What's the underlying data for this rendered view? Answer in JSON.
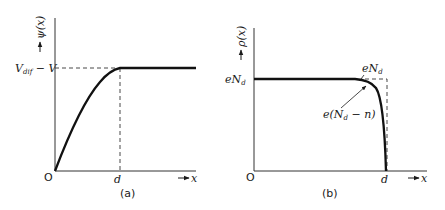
{
  "panels": [
    {
      "id": "a",
      "caption": "(a)",
      "y_axis_label": "ψ(x)",
      "x_axis_label": "x",
      "origin_label": "O",
      "x_tick_label": "d",
      "level_label": "V",
      "level_label_sub": "dif",
      "level_label_suffix": " − V",
      "curve_description": "Potential rises parabolically from 0 at x=0 to V_dif − V at x=d, constant thereafter"
    },
    {
      "id": "b",
      "caption": "(b)",
      "y_axis_label": "ρ(x)",
      "x_axis_label": "x",
      "origin_label": "O",
      "x_tick_label": "d",
      "level_label": "eN",
      "level_label_sub": "d",
      "annotation_top": "eN",
      "annotation_top_sub": "d",
      "annotation_curve_prefix": "e(N",
      "annotation_curve_sub": "d",
      "annotation_curve_suffix": " − n)",
      "curve_description": "Charge density constant at eN_d, rounding off and dropping to zero near x=d; dashed ideal step shown"
    }
  ]
}
